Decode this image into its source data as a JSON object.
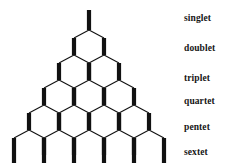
{
  "figure": {
    "title_visible": false,
    "background_color": "#ffffff",
    "stroke_color": "#111111",
    "label_color": "#161616"
  },
  "labels": [
    {
      "text": "singlet",
      "y": 13,
      "row": 1
    },
    {
      "text": "doublet",
      "y": 43,
      "row": 2
    },
    {
      "text": "triplet",
      "y": 73,
      "row": 3
    },
    {
      "text": "quartet",
      "y": 96,
      "row": 4
    },
    {
      "text": "pentet",
      "y": 122,
      "row": 5
    },
    {
      "text": "sextet",
      "y": 147,
      "row": 6
    }
  ],
  "chart_data": {
    "type": "diagram",
    "subtype": "nmr-splitting-tree",
    "title": "",
    "rows": [
      {
        "row": 1,
        "label": "singlet",
        "lines": 1,
        "intensities": [
          1
        ]
      },
      {
        "row": 2,
        "label": "doublet",
        "lines": 2,
        "intensities": [
          1,
          1
        ]
      },
      {
        "row": 3,
        "label": "triplet",
        "lines": 3,
        "intensities": [
          1,
          2,
          1
        ]
      },
      {
        "row": 4,
        "label": "quartet",
        "lines": 4,
        "intensities": [
          1,
          3,
          3,
          1
        ]
      },
      {
        "row": 5,
        "label": "pentet",
        "lines": 5,
        "intensities": [
          1,
          4,
          6,
          4,
          1
        ]
      },
      {
        "row": 6,
        "label": "sextet",
        "lines": 6,
        "intensities": [
          1,
          5,
          10,
          10,
          5,
          1
        ]
      }
    ],
    "geometry": {
      "center_x": 89,
      "column_spacing": 30,
      "row_step": 25,
      "first_node_y": 30,
      "stem_top_y": 10,
      "leg_bottom_y": 163,
      "stroke_thick": 4.2,
      "stroke_thin": 1.1
    }
  }
}
